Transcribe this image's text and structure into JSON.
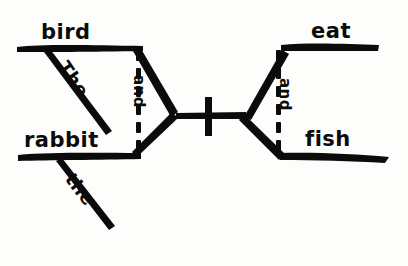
{
  "diagram": {
    "type": "reed-kellogg-sentence-diagram",
    "style": "hand-drawn ink on white paper",
    "sentence": "The bird and the rabbit eat and fish",
    "ink_color": "#0b0b0b",
    "paper_color": "#fdfdfc",
    "subjects": {
      "upper": {
        "noun": "bird",
        "article": "The"
      },
      "lower": {
        "noun": "rabbit",
        "article": "the"
      },
      "conjunction": "and"
    },
    "predicates": {
      "upper": {
        "verb": "eat"
      },
      "lower": {
        "verb": "fish"
      },
      "conjunction": "and"
    },
    "divider": {
      "name": "subject-predicate-divider",
      "orientation": "vertical"
    }
  },
  "labels": {
    "subject_noun_upper": "bird",
    "subject_noun_lower": "rabbit",
    "subject_article_upper": "The",
    "subject_article_lower": "the",
    "subject_conjunction": "and",
    "predicate_verb_upper": "eat",
    "predicate_verb_lower": "fish",
    "predicate_conjunction": "and"
  }
}
